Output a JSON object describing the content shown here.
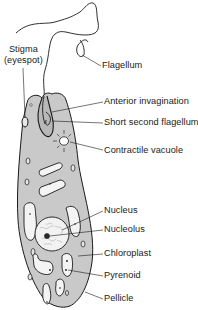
{
  "diagram": {
    "colors": {
      "cytoplasm": "#c9c9c9",
      "outline": "#1a1a1a",
      "organelle_fill": "#f4f4f4",
      "background": "#ffffff"
    },
    "labels": {
      "stigma_line1": "Stigma",
      "stigma_line2": "(eyespot)",
      "flagellum": "Flagellum",
      "anterior_invagination": "Anterior invagination",
      "short_second_flagellum": "Short second flagellum",
      "contractile_vacuole": "Contractile vacuole",
      "nucleus": "Nucleus",
      "nucleolus": "Nucleolus",
      "chloroplast": "Chloroplast",
      "pyrenoid": "Pyrenoid",
      "pellicle": "Pellicle"
    }
  }
}
